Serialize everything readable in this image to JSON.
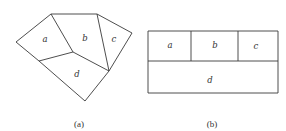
{
  "panels": [
    {
      "id": "a",
      "caption": "(a)",
      "description": "Irregular polygon partitioned into four regions",
      "regions": [
        {
          "label": "a"
        },
        {
          "label": "b"
        },
        {
          "label": "c"
        },
        {
          "label": "d"
        }
      ]
    },
    {
      "id": "b",
      "caption": "(b)",
      "description": "Rectangular layout with a, b, c across the top row and d spanning the bottom row",
      "regions": [
        {
          "label": "a"
        },
        {
          "label": "b"
        },
        {
          "label": "c"
        },
        {
          "label": "d"
        }
      ]
    }
  ]
}
